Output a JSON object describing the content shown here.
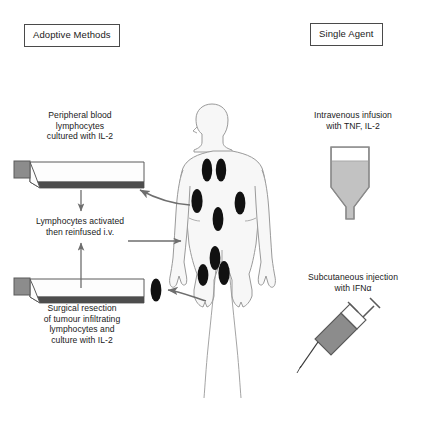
{
  "figure": {
    "columns": [
      {
        "key": "adoptive",
        "label": "Adoptive Methods"
      },
      {
        "key": "single",
        "label": "Single Agent"
      }
    ]
  },
  "headings": {
    "adoptive": "Adoptive Methods",
    "single_agent": "Single Agent"
  },
  "captions": {
    "peripheral_blood": "Peripheral blood\nlymphocytes\ncultured with IL-2",
    "reinfused": "Lymphocytes activated\nthen reinfused i.v.",
    "surgical_resection": "Surgical resection\nof tumour infiltrating\nlymphocytes and\nculture with IL-2",
    "intravenous": "Intravenous infusion\nwith TNF, IL-2",
    "subcutaneous": "Subcutaneous injection\nwith IFNα"
  },
  "icons": {
    "culture_flask_top": "culture-flask-icon",
    "culture_flask_bottom": "culture-flask-icon",
    "iv_bag": "iv-bag-icon",
    "syringe": "syringe-icon",
    "patient": "human-body-silhouette-icon",
    "tumour": "tumour-nodule-icon"
  },
  "arrows": [
    {
      "name": "blood-draw-arrow",
      "direction": "curved-left",
      "from": "patient-chest",
      "to": "culture-flask-top"
    },
    {
      "name": "flask-to-reinfusion-arrow",
      "direction": "down",
      "from": "culture-flask-top",
      "to": "reinfusion-caption"
    },
    {
      "name": "reinfusion-to-patient-arrow",
      "direction": "right",
      "from": "reinfusion-caption",
      "to": "patient-torso"
    },
    {
      "name": "resection-to-flask-arrow",
      "direction": "curved-left",
      "from": "patient-hip-tumour",
      "to": "resected-tumour"
    },
    {
      "name": "flask-to-reinfusion-up-arrow",
      "direction": "up",
      "from": "culture-flask-bottom",
      "to": "reinfusion-caption"
    }
  ],
  "tumours": {
    "count": 9,
    "locations": [
      "neck-left",
      "neck-right",
      "chest-left",
      "chest-right",
      "abdomen-center",
      "pelvis-center",
      "hip-left",
      "hip-right",
      "resected-specimen"
    ]
  },
  "colors": {
    "tumour": "#111111",
    "body_fill": "#f7f7f7",
    "body_outline": "#9a9a9a",
    "flask_body": "#fdfdfd",
    "flask_base": "#4d4d4d",
    "flask_cap": "#8c8c8c",
    "fluid": "#c2c2c2",
    "arrow": "#6e6e6e",
    "text": "#1a1a1a",
    "box_border": "#4a4a4a",
    "background": "#ffffff"
  }
}
